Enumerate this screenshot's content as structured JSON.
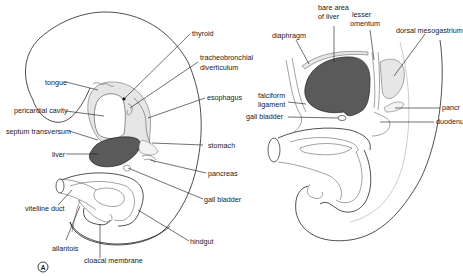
{
  "figure": {
    "panel_label": "A",
    "colors": {
      "background": "#ffffff",
      "line": "#222222",
      "liver_fill": "#5a5a5a",
      "stipple_fill": "#e6e6e6"
    },
    "left_panel": {
      "labels": {
        "thyroid": "thyroid",
        "tracheobronchial_1": "tracheobronchial",
        "tracheobronchial_2": "diverticulum",
        "tongue": "tongue",
        "pericardial_cavity": "pericardial cavity",
        "esophagus": "esophagus",
        "septum_transversum": "septum transversum",
        "stomach": "stomach",
        "liver": "liver",
        "pancreas": "pancreas",
        "gall_bladder": "gall bladder",
        "vitelline_duct": "vitelline duct",
        "hindgut": "hindgut",
        "allantois": "allantois",
        "cloacal_membrane": "cloacal membrane"
      }
    },
    "right_panel": {
      "labels": {
        "bare_area_1": "bare area",
        "bare_area_2": "of liver",
        "lesser_omentum_1": "lesser",
        "lesser_omentum_2": "omentum",
        "diaphragm": "diaphragm",
        "dorsal_mesogastrium": "dorsal mesogastrium",
        "falciform_1": "falciform",
        "falciform_2": "ligament",
        "gall_bladder": "gall bladder",
        "pancreas": "pancr",
        "duodenum": "duodenu"
      }
    }
  }
}
